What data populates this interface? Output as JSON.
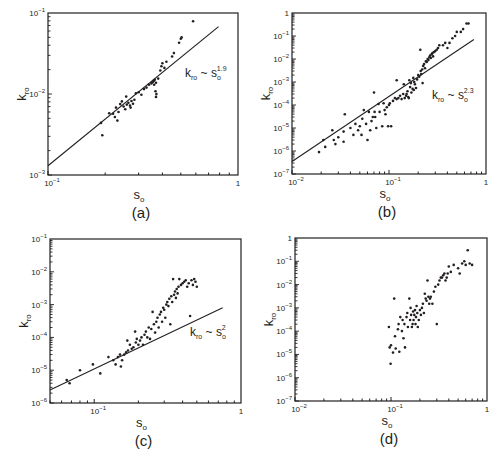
{
  "chart_data": [
    {
      "id": "a",
      "type": "scatter",
      "title": "(a)",
      "xlabel": "s_o",
      "ylabel": "k_ro",
      "xscale": "log",
      "yscale": "log",
      "xlim": [
        0.1,
        1
      ],
      "ylim": [
        0.001,
        0.1
      ],
      "xticks": [
        "10^-1",
        "1"
      ],
      "yticks": [
        "10^-3",
        "10^-2",
        "10^-1"
      ],
      "box": [
        48,
        13,
        238,
        175
      ],
      "fit_line": {
        "label": "k_ro ~ s_o^1.9",
        "exponent": 1.9,
        "from": [
          0.1,
          0.0013
        ],
        "to": [
          0.79,
          0.068
        ]
      },
      "annotation_pos": [
        185,
        77
      ],
      "points": [
        [
          0.19,
          0.0044
        ],
        [
          0.193,
          0.0031
        ],
        [
          0.21,
          0.0058
        ],
        [
          0.22,
          0.0057
        ],
        [
          0.225,
          0.0052
        ],
        [
          0.228,
          0.0068
        ],
        [
          0.232,
          0.0047
        ],
        [
          0.235,
          0.006
        ],
        [
          0.24,
          0.0075
        ],
        [
          0.245,
          0.0081
        ],
        [
          0.25,
          0.007
        ],
        [
          0.255,
          0.0065
        ],
        [
          0.258,
          0.0093
        ],
        [
          0.26,
          0.0074
        ],
        [
          0.265,
          0.0078
        ],
        [
          0.27,
          0.0072
        ],
        [
          0.272,
          0.0068
        ],
        [
          0.275,
          0.0082
        ],
        [
          0.28,
          0.0076
        ],
        [
          0.285,
          0.0085
        ],
        [
          0.29,
          0.0102
        ],
        [
          0.3,
          0.0105
        ],
        [
          0.31,
          0.0098
        ],
        [
          0.32,
          0.0115
        ],
        [
          0.33,
          0.012
        ],
        [
          0.34,
          0.013
        ],
        [
          0.35,
          0.0135
        ],
        [
          0.355,
          0.014
        ],
        [
          0.36,
          0.0145
        ],
        [
          0.362,
          0.013
        ],
        [
          0.365,
          0.015
        ],
        [
          0.37,
          0.0138
        ],
        [
          0.368,
          0.0108
        ],
        [
          0.37,
          0.0092
        ],
        [
          0.372,
          0.01
        ],
        [
          0.38,
          0.0155
        ],
        [
          0.39,
          0.0195
        ],
        [
          0.395,
          0.022
        ],
        [
          0.4,
          0.024
        ],
        [
          0.41,
          0.021
        ],
        [
          0.42,
          0.025
        ],
        [
          0.45,
          0.029
        ],
        [
          0.46,
          0.032
        ],
        [
          0.49,
          0.043
        ],
        [
          0.5,
          0.048
        ],
        [
          0.505,
          0.05
        ],
        [
          0.58,
          0.079
        ]
      ]
    },
    {
      "id": "b",
      "type": "scatter",
      "title": "(b)",
      "xlabel": "s_o",
      "ylabel": "k_ro",
      "xscale": "log",
      "yscale": "log",
      "xlim": [
        0.01,
        1
      ],
      "ylim": [
        1e-07,
        1
      ],
      "xticks": [
        "10^-2",
        "10^-1",
        "1"
      ],
      "yticks": [
        "10^-7",
        "10^-6",
        "10^-5",
        "10^-4",
        "10^-3",
        "10^-2",
        "10^-1",
        "1"
      ],
      "box": [
        292,
        13,
        486,
        174
      ],
      "fit_line": {
        "label": "k_ro ~ s_o^2.3",
        "exponent": 2.3,
        "from": [
          0.01,
          3.5e-07
        ],
        "to": [
          0.75,
          0.07
        ]
      },
      "annotation_pos": [
        432,
        99
      ],
      "points": [
        [
          0.019,
          9e-07
        ],
        [
          0.021,
          3e-06
        ],
        [
          0.022,
          1.5e-06
        ],
        [
          0.026,
          8e-06
        ],
        [
          0.027,
          3e-06
        ],
        [
          0.028,
          2e-06
        ],
        [
          0.03,
          4e-06
        ],
        [
          0.034,
          2.5e-06
        ],
        [
          0.035,
          4e-05
        ],
        [
          0.034,
          7e-06
        ],
        [
          0.04,
          1e-05
        ],
        [
          0.043,
          5e-06
        ],
        [
          0.045,
          1.5e-05
        ],
        [
          0.048,
          8e-06
        ],
        [
          0.05,
          1.2e-05
        ],
        [
          0.052,
          5e-06
        ],
        [
          0.053,
          2.5e-05
        ],
        [
          0.055,
          6e-05
        ],
        [
          0.058,
          1.5e-05
        ],
        [
          0.06,
          3e-06
        ],
        [
          0.062,
          5e-05
        ],
        [
          0.064,
          8e-06
        ],
        [
          0.066,
          2e-05
        ],
        [
          0.068,
          3e-05
        ],
        [
          0.07,
          0.00035
        ],
        [
          0.071,
          5e-05
        ],
        [
          0.072,
          3e-05
        ],
        [
          0.074,
          1e-05
        ],
        [
          0.078,
          0.00011
        ],
        [
          0.08,
          5e-05
        ],
        [
          0.085,
          1.2e-05
        ],
        [
          0.088,
          0.00012
        ],
        [
          0.09,
          6e-05
        ],
        [
          0.092,
          4e-05
        ],
        [
          0.095,
          8e-05
        ],
        [
          0.098,
          1.2e-05
        ],
        [
          0.1,
          0.0001
        ],
        [
          0.102,
          0.00012
        ],
        [
          0.105,
          1.2e-05
        ],
        [
          0.11,
          0.00015
        ],
        [
          0.115,
          0.0002
        ],
        [
          0.12,
          0.00018
        ],
        [
          0.12,
          0.0012
        ],
        [
          0.125,
          0.0002
        ],
        [
          0.13,
          0.00025
        ],
        [
          0.135,
          0.00018
        ],
        [
          0.14,
          0.0003
        ],
        [
          0.142,
          0.0008
        ],
        [
          0.145,
          0.0002
        ],
        [
          0.15,
          0.00025
        ],
        [
          0.152,
          0.0003
        ],
        [
          0.155,
          0.0004
        ],
        [
          0.158,
          0.00022
        ],
        [
          0.16,
          0.0002
        ],
        [
          0.162,
          0.0012
        ],
        [
          0.165,
          0.0006
        ],
        [
          0.168,
          0.0009
        ],
        [
          0.17,
          0.00035
        ],
        [
          0.175,
          0.0005
        ],
        [
          0.178,
          0.0015
        ],
        [
          0.18,
          0.00045
        ],
        [
          0.182,
          0.001
        ],
        [
          0.185,
          0.0008
        ],
        [
          0.19,
          0.00055
        ],
        [
          0.195,
          0.0013
        ],
        [
          0.2,
          0.002
        ],
        [
          0.205,
          0.0017
        ],
        [
          0.21,
          0.025
        ],
        [
          0.212,
          0.003
        ],
        [
          0.215,
          0.0022
        ],
        [
          0.22,
          0.0035
        ],
        [
          0.222,
          0.0009
        ],
        [
          0.225,
          0.005
        ],
        [
          0.23,
          0.006
        ],
        [
          0.235,
          0.004
        ],
        [
          0.24,
          0.008
        ],
        [
          0.245,
          0.0075
        ],
        [
          0.25,
          0.01
        ],
        [
          0.255,
          0.009
        ],
        [
          0.26,
          0.012
        ],
        [
          0.265,
          0.014
        ],
        [
          0.27,
          0.011
        ],
        [
          0.275,
          0.016
        ],
        [
          0.28,
          0.018
        ],
        [
          0.285,
          0.013
        ],
        [
          0.29,
          0.02
        ],
        [
          0.3,
          0.022
        ],
        [
          0.31,
          0.025
        ],
        [
          0.32,
          0.03
        ],
        [
          0.33,
          0.04
        ],
        [
          0.36,
          0.04
        ],
        [
          0.38,
          0.05
        ],
        [
          0.4,
          0.03
        ],
        [
          0.42,
          0.05
        ],
        [
          0.45,
          0.08
        ],
        [
          0.48,
          0.1
        ],
        [
          0.5,
          0.15
        ],
        [
          0.55,
          0.15
        ],
        [
          0.58,
          0.2
        ],
        [
          0.63,
          0.35
        ],
        [
          0.66,
          0.35
        ]
      ]
    },
    {
      "id": "c",
      "type": "scatter",
      "title": "(c)",
      "xlabel": "s_o",
      "ylabel": "k_ro",
      "xscale": "log",
      "yscale": "log",
      "xlim": [
        0.05,
        1
      ],
      "ylim": [
        1e-06,
        0.1
      ],
      "xticks": [
        "10^-1",
        "1"
      ],
      "yticks": [
        "10^-6",
        "10^-5",
        "10^-4",
        "10^-3",
        "10^-2",
        "10^-1"
      ],
      "box": [
        50,
        239,
        241,
        403
      ],
      "fit_line": {
        "label": "k_ro ~ s_o^2",
        "exponent": 2,
        "from": [
          0.05,
          2.5e-06
        ],
        "to": [
          0.75,
          0.0008
        ]
      },
      "annotation_pos": [
        190,
        336
      ],
      "points": [
        [
          0.065,
          5e-06
        ],
        [
          0.068,
          4e-06
        ],
        [
          0.08,
          1e-05
        ],
        [
          0.098,
          1.5e-05
        ],
        [
          0.11,
          8e-06
        ],
        [
          0.125,
          2.5e-05
        ],
        [
          0.135,
          2e-05
        ],
        [
          0.14,
          1.5e-05
        ],
        [
          0.145,
          2.5e-05
        ],
        [
          0.15,
          3e-05
        ],
        [
          0.152,
          1.3e-05
        ],
        [
          0.155,
          2e-05
        ],
        [
          0.16,
          3e-05
        ],
        [
          0.165,
          3.5e-05
        ],
        [
          0.168,
          8e-05
        ],
        [
          0.17,
          4e-05
        ],
        [
          0.175,
          6e-05
        ],
        [
          0.18,
          4.5e-05
        ],
        [
          0.185,
          5e-05
        ],
        [
          0.19,
          0.00015
        ],
        [
          0.192,
          7e-05
        ],
        [
          0.195,
          9e-05
        ],
        [
          0.2,
          6e-05
        ],
        [
          0.205,
          8e-05
        ],
        [
          0.21,
          0.0001
        ],
        [
          0.215,
          6e-05
        ],
        [
          0.22,
          0.00012
        ],
        [
          0.225,
          0.00015
        ],
        [
          0.23,
          0.0001
        ],
        [
          0.235,
          0.0002
        ],
        [
          0.24,
          9e-05
        ],
        [
          0.245,
          0.00018
        ],
        [
          0.25,
          0.0006
        ],
        [
          0.255,
          0.00025
        ],
        [
          0.26,
          0.00014
        ],
        [
          0.265,
          0.0003
        ],
        [
          0.27,
          0.0004
        ],
        [
          0.275,
          0.0002
        ],
        [
          0.28,
          0.0005
        ],
        [
          0.285,
          0.0006
        ],
        [
          0.29,
          0.0003
        ],
        [
          0.295,
          0.0008
        ],
        [
          0.3,
          0.0007
        ],
        [
          0.305,
          0.0004
        ],
        [
          0.31,
          0.001
        ],
        [
          0.315,
          0.0012
        ],
        [
          0.32,
          0.0009
        ],
        [
          0.325,
          0.0015
        ],
        [
          0.33,
          0.00025
        ],
        [
          0.335,
          0.0018
        ],
        [
          0.34,
          0.0012
        ],
        [
          0.345,
          0.006
        ],
        [
          0.35,
          0.002
        ],
        [
          0.355,
          0.0025
        ],
        [
          0.36,
          0.0016
        ],
        [
          0.365,
          0.003
        ],
        [
          0.37,
          0.0022
        ],
        [
          0.375,
          0.0035
        ],
        [
          0.38,
          0.006
        ],
        [
          0.39,
          0.004
        ],
        [
          0.4,
          0.0045
        ],
        [
          0.41,
          0.005
        ],
        [
          0.42,
          0.0055
        ],
        [
          0.43,
          0.0035
        ],
        [
          0.44,
          0.0045
        ],
        [
          0.45,
          0.00045
        ],
        [
          0.46,
          0.0055
        ],
        [
          0.47,
          0.004
        ],
        [
          0.48,
          0.006
        ],
        [
          0.49,
          0.005
        ],
        [
          0.5,
          0.0035
        ]
      ]
    },
    {
      "id": "d",
      "type": "scatter",
      "title": "(d)",
      "xlabel": "s_o",
      "ylabel": "k_ro",
      "xscale": "log",
      "yscale": "log",
      "xlim": [
        0.01,
        1
      ],
      "ylim": [
        1e-07,
        1
      ],
      "xticks": [
        "10^-2",
        "10^-1",
        "1"
      ],
      "yticks": [
        "10^-7",
        "10^-6",
        "10^-5",
        "10^-4",
        "10^-3",
        "10^-2",
        "10^-1",
        "1"
      ],
      "box": [
        295,
        238,
        487,
        401
      ],
      "fit_line": null,
      "points": [
        [
          0.095,
          0.00015
        ],
        [
          0.097,
          2e-05
        ],
        [
          0.099,
          4e-06
        ],
        [
          0.1,
          2.5e-05
        ],
        [
          0.105,
          1.2e-05
        ],
        [
          0.108,
          0.0025
        ],
        [
          0.11,
          6e-05
        ],
        [
          0.112,
          1.8e-05
        ],
        [
          0.118,
          0.00012
        ],
        [
          0.12,
          0.0002
        ],
        [
          0.122,
          1.3e-05
        ],
        [
          0.125,
          0.0004
        ],
        [
          0.13,
          0.0001
        ],
        [
          0.132,
          0.0003
        ],
        [
          0.135,
          5e-05
        ],
        [
          0.138,
          0.0002
        ],
        [
          0.14,
          2e-05
        ],
        [
          0.145,
          0.0004
        ],
        [
          0.148,
          0.0006
        ],
        [
          0.15,
          0.00015
        ],
        [
          0.155,
          0.0025
        ],
        [
          0.158,
          0.0003
        ],
        [
          0.16,
          0.001
        ],
        [
          0.162,
          0.0005
        ],
        [
          0.165,
          0.00015
        ],
        [
          0.168,
          0.0002
        ],
        [
          0.17,
          0.0007
        ],
        [
          0.172,
          0.0003
        ],
        [
          0.175,
          0.0005
        ],
        [
          0.178,
          0.0008
        ],
        [
          0.18,
          0.0002
        ],
        [
          0.182,
          0.0004
        ],
        [
          0.185,
          0.0012
        ],
        [
          0.188,
          0.0006
        ],
        [
          0.19,
          0.00015
        ],
        [
          0.195,
          0.0003
        ],
        [
          0.2,
          0.0008
        ],
        [
          0.205,
          0.0005
        ],
        [
          0.21,
          0.001
        ],
        [
          0.215,
          0.0015
        ],
        [
          0.22,
          0.0006
        ],
        [
          0.225,
          0.004
        ],
        [
          0.23,
          0.0025
        ],
        [
          0.235,
          0.002
        ],
        [
          0.24,
          0.015
        ],
        [
          0.245,
          0.003
        ],
        [
          0.25,
          0.0015
        ],
        [
          0.255,
          0.0025
        ],
        [
          0.26,
          0.003
        ],
        [
          0.27,
          0.0015
        ],
        [
          0.28,
          0.005
        ],
        [
          0.29,
          0.008
        ],
        [
          0.3,
          0.0002
        ],
        [
          0.31,
          0.01
        ],
        [
          0.32,
          0.015
        ],
        [
          0.33,
          0.02
        ],
        [
          0.34,
          0.02
        ],
        [
          0.35,
          0.025
        ],
        [
          0.36,
          0.03
        ],
        [
          0.37,
          0.015
        ],
        [
          0.38,
          0.02
        ],
        [
          0.39,
          0.03
        ],
        [
          0.4,
          0.06
        ],
        [
          0.42,
          0.035
        ],
        [
          0.45,
          0.07
        ],
        [
          0.5,
          0.05
        ],
        [
          0.52,
          0.03
        ],
        [
          0.55,
          0.08
        ],
        [
          0.58,
          0.1
        ],
        [
          0.6,
          0.07
        ],
        [
          0.63,
          0.3
        ],
        [
          0.66,
          0.08
        ],
        [
          0.7,
          0.07
        ]
      ]
    }
  ]
}
